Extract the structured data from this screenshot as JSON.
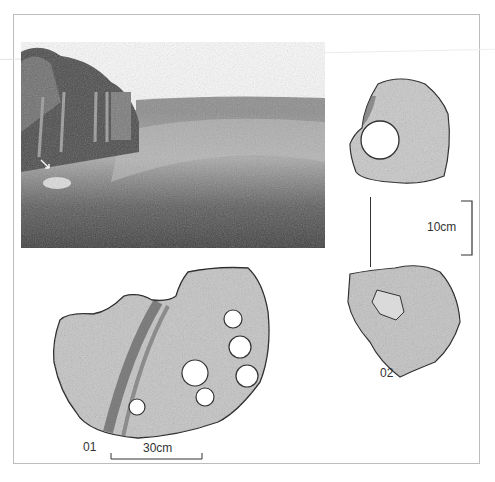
{
  "figure": {
    "photo": {
      "description": "Landscape photograph of grassy field with fence and hedge, arrow marking stone"
    },
    "artifacts": [
      {
        "id": "01",
        "label": "01",
        "scale_label": "30cm",
        "hole_count": 6
      },
      {
        "id": "02",
        "label": "02",
        "views": 2
      }
    ],
    "scale_02": {
      "label": "10cm"
    },
    "colors": {
      "frame": "#bdbdbd",
      "ink": "#333333",
      "stone_light": "#d9d9d9",
      "stone_dark": "#555555"
    }
  }
}
